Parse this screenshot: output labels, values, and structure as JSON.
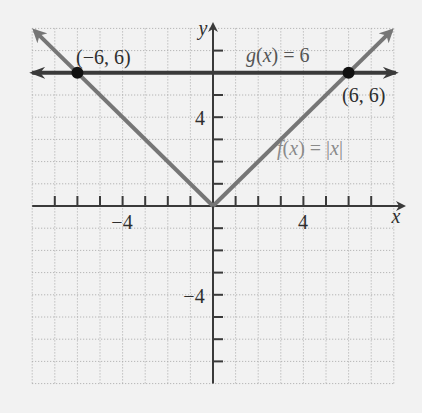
{
  "chart_data": {
    "type": "line",
    "title": "",
    "xlabel": "x",
    "ylabel": "y",
    "xlim": [
      -8,
      8
    ],
    "ylim": [
      -8,
      8
    ],
    "grid": true,
    "x_tick_labels": [
      {
        "value": -4,
        "label": "−4"
      },
      {
        "value": 4,
        "label": "4"
      }
    ],
    "y_tick_labels": [
      {
        "value": 4,
        "label": "4"
      },
      {
        "value": -4,
        "label": "−4"
      }
    ],
    "series": [
      {
        "name": "f(x) = |x|",
        "label": "f(x) = |x|",
        "color": "#767676",
        "points": [
          [
            -7.9,
            7.9
          ],
          [
            0,
            0
          ],
          [
            7.9,
            7.9
          ]
        ]
      },
      {
        "name": "g(x) = 6",
        "label": "g(x) = 6",
        "color": "#3a3a3a",
        "points": [
          [
            -8,
            6
          ],
          [
            8,
            6
          ]
        ]
      }
    ],
    "annotations": [
      {
        "text": "(−6, 6)",
        "x": -6,
        "y": 6,
        "marker": true
      },
      {
        "text": "(6, 6)",
        "x": 6,
        "y": 6,
        "marker": true
      }
    ]
  },
  "labels": {
    "x_axis": "x",
    "y_axis": "y",
    "x_neg4": "−4",
    "x_pos4": "4",
    "y_pos4": "4",
    "y_neg4": "−4",
    "g_label": "g(x) = 6",
    "f_label": "f(x) = |x|",
    "point_left": "(−6, 6)",
    "point_right": "(6, 6)"
  },
  "colors": {
    "background": "#f2f2f2",
    "axis": "#3a3a3a",
    "f_line": "#767676",
    "g_line": "#3a3a3a",
    "point": "#111111",
    "f_label": "#8a8a8a"
  }
}
